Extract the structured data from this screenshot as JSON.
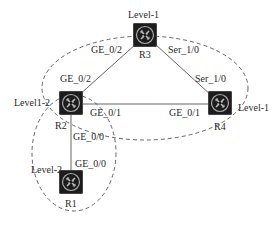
{
  "diagram": {
    "type": "network-topology",
    "areas": [
      {
        "id": "area-top",
        "label": "Level-1 area (R2, R3, R4)"
      },
      {
        "id": "area-bottom",
        "label": "Level-2 area (R1, R2)"
      }
    ],
    "routers": [
      {
        "id": "R3",
        "name": "R3",
        "level": "Level-1",
        "x": 133,
        "y": 23
      },
      {
        "id": "R2",
        "name": "R2",
        "level": "Level1-2",
        "x": 59,
        "y": 91
      },
      {
        "id": "R4",
        "name": "R4",
        "level": "Level-1",
        "x": 208,
        "y": 91
      },
      {
        "id": "R1",
        "name": "R1",
        "level": "Level-2",
        "x": 59,
        "y": 170
      }
    ],
    "links": [
      {
        "from": "R2",
        "to": "R3",
        "from_if": "GE_0/2",
        "to_if": "GE_0/2"
      },
      {
        "from": "R3",
        "to": "R4",
        "from_if": "Ser_1/0",
        "to_if": "Ser_1/0"
      },
      {
        "from": "R2",
        "to": "R4",
        "from_if": "GE_0/1",
        "to_if": "GE_0/1"
      },
      {
        "from": "R2",
        "to": "R1",
        "from_if": "GE_0/0",
        "to_if": "GE_0/0"
      }
    ],
    "labels": {
      "r3_level": "Level-1",
      "r2_level": "Level1-2",
      "r4_level": "Level-1",
      "r1_level": "Level-2",
      "r3_name": "R3",
      "r2_name": "R2",
      "r4_name": "R4",
      "r1_name": "R1",
      "r2_r3_if_r3": "GE_0/2",
      "r2_r3_if_r2": "GE_0/2",
      "r3_r4_if_r3": "Ser_1/0",
      "r3_r4_if_r4": "Ser_1/0",
      "r2_r4_if_r2": "GE_0/1",
      "r2_r4_if_r4": "GE_0/1",
      "r2_r1_if_r2": "GE_0/0",
      "r2_r1_if_r1": "GE_0/0"
    }
  }
}
